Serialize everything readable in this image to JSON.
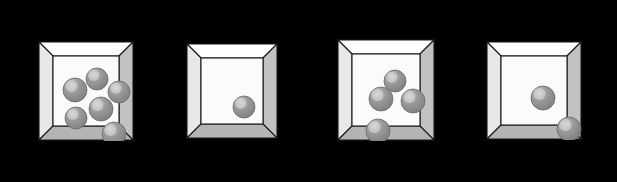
{
  "scene": {
    "title": "Boxes with marbles",
    "width": 617,
    "height": 182,
    "background_color": "#000000",
    "box_count": 4,
    "description": "Four open-topped 3D beveled boxes on a black background, each containing a different number of gray spheres (marbles)."
  },
  "palette": {
    "background": "#000000",
    "frame_top": "#ffffff",
    "frame_left": "#e8e8e8",
    "frame_right": "#c2c2c2",
    "frame_bottom": "#b4b4b4",
    "interior": "#fbfbfb",
    "outline": "#1a1a1a",
    "sphere_body": "#9a9a9a",
    "sphere_shadow": "#7e7e7e",
    "sphere_highlight": "#d8d8d8",
    "sphere_outline": "#6a6a6a"
  },
  "boxes": [
    {
      "name": "box-1",
      "index": 1,
      "label": "Box 1",
      "marble_count": 6,
      "x": 38,
      "y": 41,
      "width": 94,
      "height": 98,
      "bevel": 14,
      "marbles": [
        {
          "name": "marble-1",
          "cx": 44,
          "cy": 23,
          "r": 11
        },
        {
          "name": "marble-2",
          "cx": 22,
          "cy": 34,
          "r": 12
        },
        {
          "name": "marble-3",
          "cx": 66,
          "cy": 36,
          "r": 11
        },
        {
          "name": "marble-4",
          "cx": 48,
          "cy": 53,
          "r": 12
        },
        {
          "name": "marble-5",
          "cx": 23,
          "cy": 62,
          "r": 11
        },
        {
          "name": "marble-6",
          "cx": 61,
          "cy": 78,
          "r": 12
        }
      ]
    },
    {
      "name": "box-2",
      "index": 2,
      "label": "Box 2",
      "marble_count": 1,
      "x": 186,
      "y": 43,
      "width": 90,
      "height": 94,
      "bevel": 14,
      "marbles": [
        {
          "name": "marble-1",
          "cx": 43,
          "cy": 49,
          "r": 11
        }
      ]
    },
    {
      "name": "box-3",
      "index": 3,
      "label": "Box 3",
      "marble_count": 4,
      "x": 337,
      "y": 39,
      "width": 96,
      "height": 100,
      "bevel": 14,
      "marbles": [
        {
          "name": "marble-1",
          "cx": 43,
          "cy": 27,
          "r": 11
        },
        {
          "name": "marble-2",
          "cx": 29,
          "cy": 45,
          "r": 12
        },
        {
          "name": "marble-3",
          "cx": 61,
          "cy": 47,
          "r": 12
        },
        {
          "name": "marble-4",
          "cx": 26,
          "cy": 77,
          "r": 12
        }
      ]
    },
    {
      "name": "box-4",
      "index": 4,
      "label": "Box 4",
      "marble_count": 2,
      "x": 486,
      "y": 41,
      "width": 94,
      "height": 97,
      "bevel": 14,
      "marbles": [
        {
          "name": "marble-1",
          "cx": 42,
          "cy": 42,
          "r": 12
        },
        {
          "name": "marble-2",
          "cx": 68,
          "cy": 73,
          "r": 12
        }
      ]
    }
  ]
}
